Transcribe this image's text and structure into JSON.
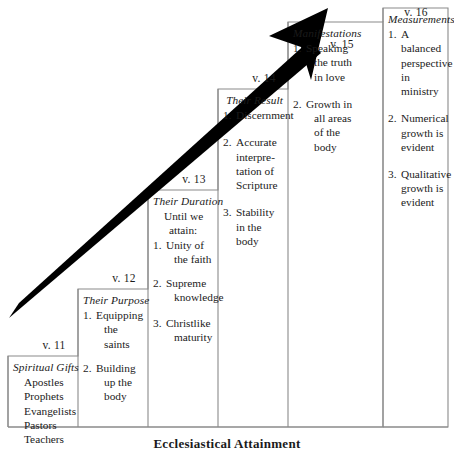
{
  "figure": {
    "caption": "Ecclesiastical Attainment",
    "arrow_icon": "upward-arrow-icon",
    "border_color": "#8a8a8a",
    "ink_color": "#1b1b1b",
    "arrow_color": "#000000"
  },
  "columns": [
    {
      "id": "v11",
      "verse": "v. 11",
      "heading": "Spiritual Gifts",
      "items": [
        {
          "marker": "",
          "lines": [
            "Apostles"
          ]
        },
        {
          "marker": "",
          "lines": [
            "Prophets"
          ]
        },
        {
          "marker": "",
          "lines": [
            "Evangelists"
          ]
        },
        {
          "marker": "",
          "lines": [
            "Pastors"
          ]
        },
        {
          "marker": "",
          "lines": [
            "Teachers"
          ]
        }
      ]
    },
    {
      "id": "v12",
      "verse": "v. 12",
      "heading": "Their Purpose",
      "items": [
        {
          "marker": "1.",
          "lines": [
            "Equipping",
            "the saints"
          ]
        },
        {
          "marker": "2.",
          "lines": [
            "Building",
            "up the",
            "body"
          ]
        }
      ]
    },
    {
      "id": "v13",
      "verse": "v. 13",
      "heading": "Their Duration",
      "lead": [
        "Until we",
        "attain:"
      ],
      "items": [
        {
          "marker": "1.",
          "lines": [
            "Unity of",
            "the faith"
          ]
        },
        {
          "marker": "2.",
          "lines": [
            "Supreme",
            "knowledge"
          ]
        },
        {
          "marker": "3.",
          "lines": [
            "Christlike",
            "maturity"
          ]
        }
      ]
    },
    {
      "id": "v14",
      "verse": "v. 14",
      "heading": "Their Result",
      "items": [
        {
          "marker": "1.",
          "lines": [
            "Discernment"
          ]
        },
        {
          "marker": "2.",
          "lines": [
            "Accurate",
            "interpre-",
            "tation of",
            "Scripture"
          ]
        },
        {
          "marker": "3.",
          "lines": [
            "Stability",
            "in the",
            "body"
          ]
        }
      ]
    },
    {
      "id": "v15",
      "verse": "v. 15",
      "heading": "Manifestations",
      "items": [
        {
          "marker": "1.",
          "lines": [
            "Speaking",
            "the truth",
            "in love"
          ]
        },
        {
          "marker": "2.",
          "lines": [
            "Growth in",
            "all areas",
            "of the",
            "body"
          ]
        }
      ]
    },
    {
      "id": "v16",
      "verse": "v. 16",
      "heading": "Measurements",
      "items": [
        {
          "marker": "1.",
          "lines": [
            "A balanced",
            "perspective",
            "in ministry"
          ]
        },
        {
          "marker": "2.",
          "lines": [
            "Numerical",
            "growth is",
            "evident"
          ]
        },
        {
          "marker": "3.",
          "lines": [
            "Qualitative",
            "growth is",
            "evident"
          ]
        }
      ]
    }
  ]
}
